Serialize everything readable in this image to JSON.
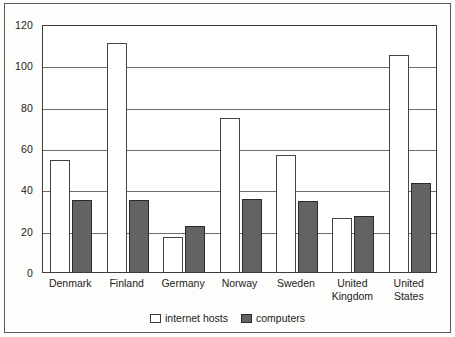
{
  "chart_data": {
    "type": "bar",
    "title": "",
    "xlabel": "",
    "ylabel": "",
    "ylim": [
      0,
      120
    ],
    "ytick_step": 20,
    "yticks": [
      0,
      20,
      40,
      60,
      80,
      100,
      120
    ],
    "grid": true,
    "legend_position": "bottom-center",
    "categories": [
      "Denmark",
      "Finland",
      "Germany",
      "Norway",
      "Sweden",
      "United\nKingdom",
      "United\nStates"
    ],
    "series": [
      {
        "name": "internet hosts",
        "color": "#ffffff",
        "edge_color": "#434343",
        "values": [
          54,
          111,
          17,
          74.5,
          56.5,
          26,
          105
        ]
      },
      {
        "name": "computers",
        "color": "#636363",
        "edge_color": "#2b2b2b",
        "values": [
          35,
          35,
          22.5,
          35.5,
          34.5,
          27,
          43
        ]
      }
    ],
    "legend": [
      "internet hosts",
      "computers"
    ]
  },
  "colors": {
    "hosts_fill": "#ffffff",
    "computers_fill": "#636363",
    "axis": "#3c3c3c",
    "grid": "#6e6e6e",
    "frame": "#5a5a5a",
    "text": "#1c1c1c",
    "background": "#fdfdfb"
  }
}
